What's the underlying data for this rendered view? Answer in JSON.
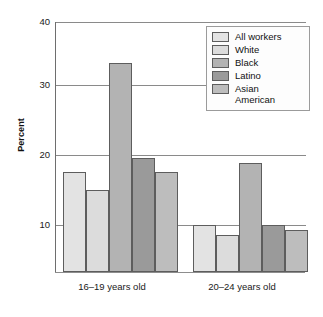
{
  "chart_data": {
    "type": "bar",
    "title": "",
    "subtitle": "",
    "xlabel": "",
    "ylabel": "Percent",
    "categories": [
      "16–19 years old",
      "20–24 years old"
    ],
    "series": [
      {
        "name": "All workers",
        "values": [
          18.0,
          10.2
        ],
        "color": "#e3e3e3"
      },
      {
        "name": "White",
        "values": [
          15.3,
          8.8
        ],
        "color": "#dcdcdc"
      },
      {
        "name": "Black",
        "values": [
          34.0,
          19.3
        ],
        "color": "#b3b3b3"
      },
      {
        "name": "Latino",
        "values": [
          20.0,
          10.2
        ],
        "color": "#9a9a9a"
      },
      {
        "name": "Asian\nAmerican",
        "values": [
          18.0,
          9.4
        ],
        "color": "#bdbdbd"
      }
    ],
    "ylim": [
      3.3,
      40
    ],
    "yticks": [
      10,
      20,
      30,
      40
    ],
    "ytick_labels": [
      "10",
      "20",
      "30",
      "40"
    ],
    "grid": true,
    "legend_position": "top-right",
    "bar_border_color": "#5d5d5d",
    "gridline_color": "#8a8a8a",
    "axis_color": "#6e6e6e",
    "background": "#ffffff"
  },
  "legend": {
    "entries": [
      {
        "label": "All workers"
      },
      {
        "label": "White"
      },
      {
        "label": "Black"
      },
      {
        "label": "Latino"
      },
      {
        "label": "Asian\nAmerican"
      }
    ]
  },
  "axes": {
    "y_title": "Percent",
    "y_ticks": [
      "40",
      "30",
      "20",
      "10"
    ],
    "x_labels": [
      "16–19 years old",
      "20–24 years old"
    ]
  }
}
